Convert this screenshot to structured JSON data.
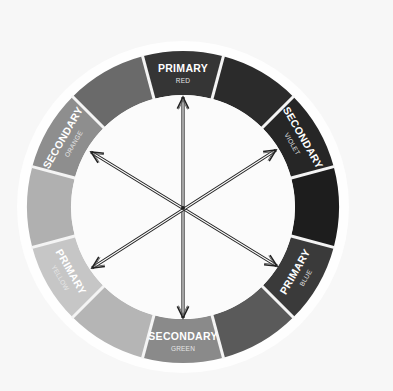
{
  "diagram": {
    "type": "color-wheel",
    "center": {
      "x": 183,
      "y": 207
    },
    "outer_radius": 156,
    "inner_radius": 112,
    "halo_radius": 166,
    "background": "#f7f7f7",
    "inner_fill": "#fbfbfb",
    "separator_color": "#f4f4f4",
    "segments": [
      {
        "name": "red",
        "angle": -90,
        "color": "#353535",
        "label": "PRIMARY",
        "sublabel": "RED"
      },
      {
        "name": "red-violet",
        "angle": -60,
        "color": "#2b2b2b"
      },
      {
        "name": "violet",
        "angle": -30,
        "color": "#262626",
        "label": "SECONDARY",
        "sublabel": "VIOLET"
      },
      {
        "name": "blue-violet",
        "angle": 0,
        "color": "#1d1d1d"
      },
      {
        "name": "blue",
        "angle": 30,
        "color": "#3a3a3a",
        "label": "PRIMARY",
        "sublabel": "BLUE"
      },
      {
        "name": "blue-green",
        "angle": 60,
        "color": "#5a5a5a"
      },
      {
        "name": "green",
        "angle": 90,
        "color": "#8a8a8a",
        "label": "SECONDARY",
        "sublabel": "GREEN"
      },
      {
        "name": "yellow-green",
        "angle": 120,
        "color": "#b5b5b5"
      },
      {
        "name": "yellow",
        "angle": 150,
        "color": "#c6c6c6",
        "label": "PRIMARY",
        "sublabel": "YELLOW"
      },
      {
        "name": "yellow-orange",
        "angle": 180,
        "color": "#b0b0b0"
      },
      {
        "name": "orange",
        "angle": 210,
        "color": "#8e8e8e",
        "label": "SECONDARY",
        "sublabel": "ORANGE"
      },
      {
        "name": "red-orange",
        "angle": 240,
        "color": "#6a6a6a"
      }
    ],
    "arrows": [
      {
        "name": "red-green-arrow",
        "from": [
          183,
          318
        ],
        "to": [
          183,
          97
        ],
        "connects": [
          "RED",
          "GREEN"
        ]
      },
      {
        "name": "orange-blue-arrow",
        "from": [
          277,
          266
        ],
        "to": [
          91,
          152
        ],
        "connects": [
          "ORANGE",
          "BLUE"
        ]
      },
      {
        "name": "violet-yellow-arrow",
        "from": [
          92,
          268
        ],
        "to": [
          276,
          150
        ],
        "connects": [
          "VIOLET",
          "YELLOW"
        ]
      }
    ]
  }
}
